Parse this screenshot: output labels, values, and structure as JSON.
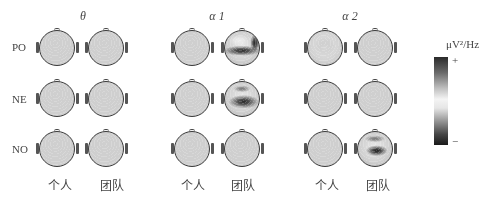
{
  "figure": {
    "columns": [
      {
        "title": "θ",
        "title_x": 63
      },
      {
        "title": "α 1",
        "title_x": 197
      },
      {
        "title": "α 2",
        "title_x": 330
      }
    ],
    "rows": [
      "PO",
      "NE",
      "NO"
    ],
    "conditions": [
      "个人",
      "团队"
    ],
    "colorbar": {
      "unit": "μV²/Hz",
      "max_label": "+",
      "min_label": "−"
    }
  },
  "chart_data": {
    "type": "heatmap",
    "subtype": "EEG scalp topographic maps (grayscale)",
    "title": "",
    "column_headers": [
      "θ",
      "α 1",
      "α 2"
    ],
    "row_headers": [
      "PO",
      "NE",
      "NO"
    ],
    "condition_labels": [
      "个人",
      "团队"
    ],
    "colorbar": {
      "label": "μV²/Hz",
      "top": "+",
      "bottom": "−",
      "scale": "dark (+) → light (mid) → dark (−)"
    },
    "panels": [
      {
        "row": "PO",
        "band": "θ",
        "condition": "个人",
        "x": 57,
        "y": 48,
        "blobs": [
          {
            "cx": 50,
            "cy": 62,
            "rx": 55,
            "ry": 18,
            "shade": "#3e3e3e"
          },
          {
            "cx": 48,
            "cy": 25,
            "rx": 22,
            "ry": 14,
            "shade": "#8a8a8a"
          },
          {
            "cx": 10,
            "cy": 55,
            "rx": 14,
            "ry": 20,
            "shade": "#444"
          },
          {
            "cx": 90,
            "cy": 55,
            "rx": 14,
            "ry": 20,
            "shade": "#444"
          }
        ]
      },
      {
        "row": "PO",
        "band": "θ",
        "condition": "团队",
        "x": 106,
        "y": 48,
        "blobs": [
          {
            "cx": 50,
            "cy": 68,
            "rx": 50,
            "ry": 22,
            "shade": "#5a5a5a"
          },
          {
            "cx": 90,
            "cy": 40,
            "rx": 14,
            "ry": 26,
            "shade": "#333"
          },
          {
            "cx": 45,
            "cy": 30,
            "rx": 25,
            "ry": 14,
            "shade": "#e6e6e6"
          }
        ]
      },
      {
        "row": "PO",
        "band": "α 1",
        "condition": "个人",
        "x": 192,
        "y": 48,
        "blobs": [
          {
            "cx": 55,
            "cy": 58,
            "rx": 50,
            "ry": 16,
            "shade": "#3f3f3f"
          },
          {
            "cx": 62,
            "cy": 62,
            "rx": 14,
            "ry": 14,
            "shade": "#222"
          },
          {
            "cx": 45,
            "cy": 25,
            "rx": 30,
            "ry": 14,
            "shade": "#e0e0e0"
          }
        ]
      },
      {
        "row": "PO",
        "band": "α 1",
        "condition": "团队",
        "x": 242,
        "y": 48,
        "blobs": [
          {
            "cx": 50,
            "cy": 58,
            "rx": 55,
            "ry": 15,
            "shade": "#2e2e2e"
          },
          {
            "cx": 88,
            "cy": 35,
            "rx": 14,
            "ry": 26,
            "shade": "#262626"
          },
          {
            "cx": 40,
            "cy": 28,
            "rx": 28,
            "ry": 16,
            "shade": "#ececec"
          }
        ]
      },
      {
        "row": "PO",
        "band": "α 2",
        "condition": "个人",
        "x": 325,
        "y": 48,
        "blobs": [
          {
            "cx": 50,
            "cy": 45,
            "rx": 30,
            "ry": 26,
            "shade": "#9a9a9a"
          },
          {
            "cx": 50,
            "cy": 50,
            "rx": 60,
            "ry": 60,
            "shade": "#d6d6d6"
          }
        ]
      },
      {
        "row": "PO",
        "band": "α 2",
        "condition": "团队",
        "x": 375,
        "y": 48,
        "blobs": [
          {
            "cx": 50,
            "cy": 58,
            "rx": 55,
            "ry": 14,
            "shade": "#222"
          },
          {
            "cx": 88,
            "cy": 35,
            "rx": 14,
            "ry": 24,
            "shade": "#333"
          },
          {
            "cx": 45,
            "cy": 25,
            "rx": 30,
            "ry": 14,
            "shade": "#efefef"
          }
        ]
      },
      {
        "row": "NE",
        "band": "θ",
        "condition": "个人",
        "x": 57,
        "y": 99,
        "blobs": [
          {
            "cx": 75,
            "cy": 58,
            "rx": 18,
            "ry": 20,
            "shade": "#1e1e1e"
          },
          {
            "cx": 28,
            "cy": 25,
            "rx": 12,
            "ry": 9,
            "shade": "#555"
          },
          {
            "cx": 40,
            "cy": 55,
            "rx": 25,
            "ry": 15,
            "shade": "#e0e0e0"
          }
        ]
      },
      {
        "row": "NE",
        "band": "θ",
        "condition": "团队",
        "x": 106,
        "y": 99,
        "blobs": [
          {
            "cx": 55,
            "cy": 58,
            "rx": 48,
            "ry": 20,
            "shade": "#262626"
          },
          {
            "cx": 50,
            "cy": 22,
            "rx": 28,
            "ry": 12,
            "shade": "#555"
          }
        ]
      },
      {
        "row": "NE",
        "band": "α 1",
        "condition": "个人",
        "x": 192,
        "y": 99,
        "blobs": [
          {
            "cx": 70,
            "cy": 60,
            "rx": 22,
            "ry": 18,
            "shade": "#1f1f1f"
          },
          {
            "cx": 25,
            "cy": 25,
            "rx": 12,
            "ry": 10,
            "shade": "#555"
          }
        ]
      },
      {
        "row": "NE",
        "band": "α 1",
        "condition": "团队",
        "x": 242,
        "y": 99,
        "blobs": [
          {
            "cx": 55,
            "cy": 58,
            "rx": 45,
            "ry": 20,
            "shade": "#2a2a2a"
          },
          {
            "cx": 50,
            "cy": 20,
            "rx": 25,
            "ry": 10,
            "shade": "#7a7a7a"
          }
        ]
      },
      {
        "row": "NE",
        "band": "α 2",
        "condition": "个人",
        "x": 325,
        "y": 99,
        "blobs": [
          {
            "cx": 68,
            "cy": 60,
            "rx": 28,
            "ry": 18,
            "shade": "#1f1f1f"
          },
          {
            "cx": 25,
            "cy": 25,
            "rx": 12,
            "ry": 10,
            "shade": "#666"
          }
        ]
      },
      {
        "row": "NE",
        "band": "α 2",
        "condition": "团队",
        "x": 375,
        "y": 99,
        "blobs": [
          {
            "cx": 58,
            "cy": 58,
            "rx": 45,
            "ry": 18,
            "shade": "#2a2a2a"
          },
          {
            "cx": 50,
            "cy": 20,
            "rx": 25,
            "ry": 10,
            "shade": "#888"
          }
        ]
      },
      {
        "row": "NO",
        "band": "θ",
        "condition": "个人",
        "x": 57,
        "y": 149,
        "blobs": [
          {
            "cx": 75,
            "cy": 45,
            "rx": 18,
            "ry": 14,
            "shade": "#3a3a3a"
          },
          {
            "cx": 45,
            "cy": 85,
            "rx": 35,
            "ry": 14,
            "shade": "#333"
          },
          {
            "cx": 40,
            "cy": 20,
            "rx": 25,
            "ry": 14,
            "shade": "#f4f4f4"
          }
        ]
      },
      {
        "row": "NO",
        "band": "θ",
        "condition": "团队",
        "x": 106,
        "y": 149,
        "blobs": [
          {
            "cx": 52,
            "cy": 62,
            "rx": 42,
            "ry": 18,
            "shade": "#1f1f1f"
          },
          {
            "cx": 50,
            "cy": 22,
            "rx": 30,
            "ry": 10,
            "shade": "#555"
          }
        ]
      },
      {
        "row": "NO",
        "band": "α 1",
        "condition": "个人",
        "x": 192,
        "y": 149,
        "blobs": [
          {
            "cx": 50,
            "cy": 50,
            "rx": 42,
            "ry": 14,
            "shade": "#3a3a3a"
          },
          {
            "cx": 50,
            "cy": 85,
            "rx": 30,
            "ry": 12,
            "shade": "#555"
          },
          {
            "cx": 45,
            "cy": 20,
            "rx": 30,
            "ry": 12,
            "shade": "#eaeaea"
          }
        ]
      },
      {
        "row": "NO",
        "band": "α 1",
        "condition": "团队",
        "x": 242,
        "y": 149,
        "blobs": [
          {
            "cx": 55,
            "cy": 55,
            "rx": 35,
            "ry": 16,
            "shade": "#222"
          },
          {
            "cx": 50,
            "cy": 20,
            "rx": 30,
            "ry": 10,
            "shade": "#6a6a6a"
          }
        ]
      },
      {
        "row": "NO",
        "band": "α 2",
        "condition": "个人",
        "x": 325,
        "y": 149,
        "blobs": [
          {
            "cx": 40,
            "cy": 52,
            "rx": 38,
            "ry": 16,
            "shade": "#1e1e1e"
          },
          {
            "cx": 45,
            "cy": 85,
            "rx": 20,
            "ry": 10,
            "shade": "#555"
          },
          {
            "cx": 50,
            "cy": 20,
            "rx": 30,
            "ry": 12,
            "shade": "#e6e6e6"
          }
        ]
      },
      {
        "row": "NO",
        "band": "α 2",
        "condition": "团队",
        "x": 375,
        "y": 149,
        "blobs": [
          {
            "cx": 55,
            "cy": 55,
            "rx": 32,
            "ry": 16,
            "shade": "#1e1e1e"
          },
          {
            "cx": 50,
            "cy": 20,
            "rx": 30,
            "ry": 10,
            "shade": "#7a7a7a"
          }
        ]
      }
    ]
  }
}
